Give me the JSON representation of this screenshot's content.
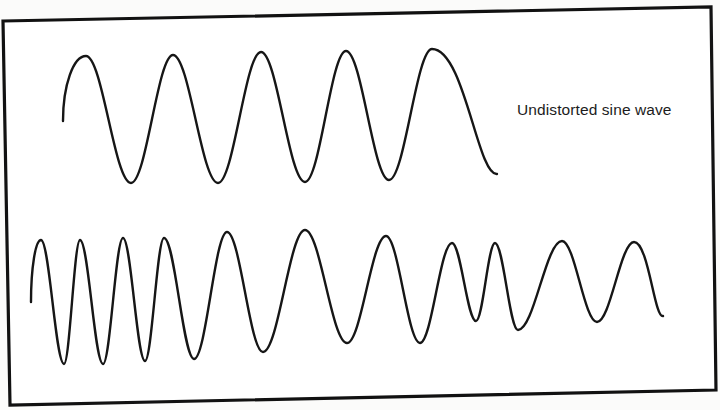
{
  "figure": {
    "label": "Undistorted sine wave",
    "colors": {
      "background": "#ffffff",
      "ink": "#161616",
      "frame": "#111111"
    },
    "frame_corners": [
      [
        3,
        21
      ],
      [
        711,
        7
      ],
      [
        716,
        390
      ],
      [
        10,
        405
      ]
    ],
    "waves": [
      {
        "name": "undistorted-sine-wave",
        "description": "Regular sine wave with constant amplitude and frequency",
        "start": [
          63,
          121
        ],
        "crests": [
          [
            86,
            56
          ],
          [
            173,
            55
          ],
          [
            261,
            52
          ],
          [
            346,
            51
          ],
          [
            432,
            49
          ]
        ],
        "troughs": [
          [
            131,
            183
          ],
          [
            218,
            183
          ],
          [
            305,
            182
          ],
          [
            389,
            180
          ]
        ],
        "end": [
          497,
          174
        ]
      },
      {
        "name": "distorted-wave",
        "description": "Wave with varying frequency and amplitude",
        "start": [
          31,
          302
        ],
        "crests": [
          [
            41,
            240
          ],
          [
            80,
            240
          ],
          [
            123,
            238
          ],
          [
            164,
            238
          ],
          [
            227,
            232
          ],
          [
            305,
            230
          ],
          [
            386,
            236
          ],
          [
            452,
            243
          ],
          [
            495,
            243
          ],
          [
            562,
            241
          ],
          [
            634,
            242
          ]
        ],
        "troughs": [
          [
            64,
            364
          ],
          [
            103,
            364
          ],
          [
            145,
            361
          ],
          [
            194,
            359
          ],
          [
            263,
            352
          ],
          [
            347,
            343
          ],
          [
            420,
            343
          ],
          [
            476,
            321
          ],
          [
            518,
            330
          ],
          [
            597,
            322
          ]
        ],
        "end": [
          663,
          316
        ]
      }
    ]
  }
}
